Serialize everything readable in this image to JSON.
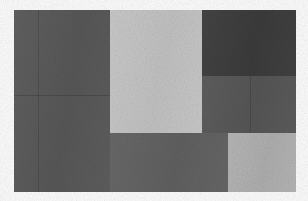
{
  "figure": {
    "kind": "abstract-block-mosaic",
    "canvas_width": 308,
    "canvas_height": 201,
    "background_color": "#fdfdfd",
    "content_bounds": {
      "x": 14,
      "y": 10,
      "width": 282,
      "height": 182
    }
  },
  "palette": {
    "page_background": "#fdfdfd",
    "left_column_gray": "#5a5a5a",
    "center_light_gray": "#c8c8c8",
    "top_right_darkest": "#3d3d3d",
    "mid_right_gray": "#585858",
    "bottom_middle_gray": "#636363",
    "bottom_right_light_gray": "#b4b4b4",
    "seam_line": "rgba(0,0,0,0.15)"
  },
  "blocks": [
    {
      "id": "left-column",
      "label": "Left column block",
      "color": "#5a5a5a",
      "x": 14,
      "y": 10,
      "width": 96,
      "height": 182
    },
    {
      "id": "center-top-light",
      "label": "Center upper light block",
      "color": "#c8c8c8",
      "x": 110,
      "y": 10,
      "width": 92,
      "height": 123
    },
    {
      "id": "top-right-dark",
      "label": "Top right darkest block",
      "color": "#3d3d3d",
      "x": 202,
      "y": 10,
      "width": 94,
      "height": 66
    },
    {
      "id": "mid-right-band",
      "label": "Middle right gray band",
      "color": "#585858",
      "x": 202,
      "y": 76,
      "width": 94,
      "height": 57
    },
    {
      "id": "bottom-middle",
      "label": "Bottom middle block",
      "color": "#636363",
      "x": 110,
      "y": 133,
      "width": 118,
      "height": 59
    },
    {
      "id": "bottom-right-light",
      "label": "Bottom right light block",
      "color": "#b4b4b4",
      "x": 228,
      "y": 133,
      "width": 68,
      "height": 59
    }
  ],
  "seams": [
    {
      "id": "left-vertical-seam",
      "label": "Left column vertical seam",
      "orientation": "vertical",
      "x": 38,
      "y": 10,
      "length": 182
    },
    {
      "id": "left-horizontal-seam",
      "label": "Left column horizontal seam",
      "orientation": "horizontal",
      "x": 14,
      "y": 95,
      "length": 96
    },
    {
      "id": "mid-right-vertical-seam",
      "label": "Middle right band vertical seam",
      "orientation": "vertical",
      "x": 250,
      "y": 76,
      "length": 57
    }
  ]
}
